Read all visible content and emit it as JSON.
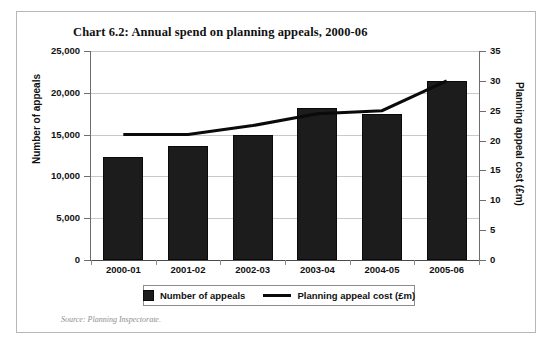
{
  "figure": {
    "title": "Chart 6.2: Annual spend on planning appeals, 2000-06",
    "source_note": "Source: Planning Inspectorate.",
    "bar_color": "#1c1c1c",
    "line_color": "#0a0a0a",
    "grid_color": "#c9c9c9",
    "frame_color": "#b7b7b7"
  },
  "legend": {
    "bar_label": "Number of appeals",
    "line_label": "Planning appeal cost (£m)"
  },
  "chart_data": {
    "type": "bar",
    "title": "Chart 6.2: Annual spend on planning appeals, 2000-06",
    "xlabel": "",
    "ylabel": "Number of appeals",
    "y2label": "Planning appeal cost (£m)",
    "categories": [
      "2000-01",
      "2001-02",
      "2002-03",
      "2003-04",
      "2004-05",
      "2005-06"
    ],
    "ylim": [
      0,
      25000
    ],
    "y2lim": [
      0,
      35
    ],
    "yticks": [
      "0",
      "5,000",
      "10,000",
      "15,000",
      "20,000",
      "25,000"
    ],
    "ytick_values": [
      0,
      5000,
      10000,
      15000,
      20000,
      25000
    ],
    "y2ticks": [
      "0",
      "5",
      "10",
      "15",
      "20",
      "25",
      "30",
      "35"
    ],
    "y2tick_values": [
      0,
      5,
      10,
      15,
      20,
      25,
      30,
      35
    ],
    "grid": true,
    "legend_position": "bottom",
    "series": [
      {
        "name": "Number of appeals",
        "type": "bar",
        "axis": "left",
        "values": [
          12300,
          13600,
          15000,
          18200,
          17500,
          21400
        ]
      },
      {
        "name": "Planning appeal cost (£m)",
        "type": "line",
        "axis": "right",
        "values": [
          21,
          21,
          22.5,
          24.5,
          25,
          30
        ]
      }
    ]
  }
}
